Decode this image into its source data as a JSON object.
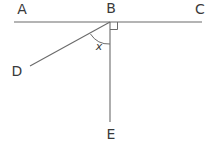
{
  "diagram": {
    "kind": "geometry-angle-diagram",
    "background_color": "#ffffff",
    "stroke_color": "#6b6b6b",
    "text_color": "#3a3a3a",
    "points": {
      "A": {
        "label": "A",
        "x": 22,
        "y": 14
      },
      "B": {
        "label": "B",
        "x": 111,
        "y": 13
      },
      "C": {
        "label": "C",
        "x": 200,
        "y": 14
      },
      "D": {
        "label": "D",
        "x": 17,
        "y": 76
      },
      "E": {
        "label": "E",
        "x": 111,
        "y": 139
      }
    },
    "vertex": {
      "x": 110,
      "y": 22
    },
    "lines": {
      "AC": {
        "name": "line-AC",
        "x1": 14,
        "y1": 22,
        "x2": 202,
        "y2": 22
      },
      "BD": {
        "name": "ray-BD",
        "x1": 110,
        "y1": 22,
        "x2": 30,
        "y2": 66
      },
      "BE": {
        "name": "ray-BE",
        "x1": 110,
        "y1": 22,
        "x2": 110,
        "y2": 122
      }
    },
    "angle_arc": {
      "name": "angle-arc-DBE",
      "label": "x",
      "label_x": 99,
      "label_y": 50,
      "radius": 22,
      "path": "M 90.5 34 A 22 22 0 0 0 110 44"
    },
    "right_angle_mark": {
      "name": "right-angle-EBC",
      "path": "M 110 29.5 L 117.5 29.5 L 117.5 22"
    }
  }
}
